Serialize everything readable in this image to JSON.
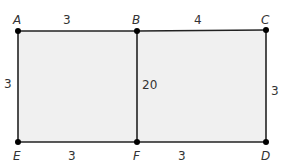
{
  "diagram": {
    "fill_color": "#f0f0f0",
    "stroke_color": "#222222",
    "points": {
      "A": {
        "label": "A",
        "x": 18,
        "y": 31
      },
      "B": {
        "label": "B",
        "x": 137,
        "y": 31
      },
      "C": {
        "label": "C",
        "x": 266,
        "y": 30
      },
      "D": {
        "label": "D",
        "x": 266,
        "y": 142
      },
      "E": {
        "label": "E",
        "x": 18,
        "y": 142
      },
      "F": {
        "label": "F",
        "x": 137,
        "y": 142
      }
    },
    "measurements": {
      "AB": "3",
      "BC": "4",
      "AE": "3",
      "CD": "3",
      "EF": "3",
      "FD": "3",
      "BF": "20"
    }
  }
}
